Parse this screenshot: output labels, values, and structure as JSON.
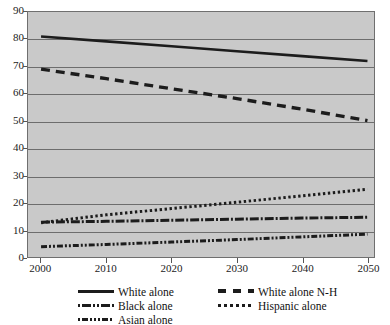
{
  "chart_data": {
    "type": "line",
    "title": "",
    "subtitle": "",
    "xlabel": "",
    "ylabel": "",
    "x": [
      2000,
      2010,
      2020,
      2030,
      2040,
      2050
    ],
    "xlim": [
      1998,
      2051
    ],
    "ylim": [
      0,
      90
    ],
    "xticks": [
      "2000",
      "2010",
      "2020",
      "2030",
      "2040",
      "2050"
    ],
    "yticks": [
      "0",
      "10",
      "20",
      "30",
      "40",
      "50",
      "60",
      "70",
      "80",
      "90"
    ],
    "grid": true,
    "legend_position": "bottom",
    "plot_background": "#c9c9c9",
    "line_color": "#1c1c1c",
    "series": [
      {
        "name": "White alone",
        "style": "solid",
        "values": [
          81,
          79.2,
          77.4,
          75.6,
          73.8,
          72
        ]
      },
      {
        "name": "White alone N-H",
        "style": "long-dash",
        "values": [
          69,
          65.5,
          61.8,
          58.2,
          54.3,
          50.1
        ]
      },
      {
        "name": "Black alone",
        "style": "dash-dot",
        "values": [
          12.8,
          13.1,
          13.5,
          13.9,
          14.3,
          14.6
        ]
      },
      {
        "name": "Hispanic alone",
        "style": "dotted",
        "values": [
          12.6,
          15.5,
          17.8,
          20.1,
          22.5,
          24.9
        ]
      },
      {
        "name": "Asian alone",
        "style": "dash-dot-dot",
        "values": [
          3.8,
          4.6,
          5.5,
          6.4,
          7.4,
          8.4
        ]
      }
    ]
  },
  "axes": {
    "y_tick_labels": [
      "90",
      "80",
      "70",
      "60",
      "50",
      "40",
      "30",
      "20",
      "10",
      "0"
    ],
    "x_tick_labels": [
      "2000",
      "2010",
      "2020",
      "2030",
      "2040",
      "2050"
    ]
  },
  "legend": {
    "items": [
      {
        "label": "White alone",
        "style": "solid",
        "col": 0,
        "row": 0
      },
      {
        "label": "White alone N-H",
        "style": "long-dash",
        "col": 1,
        "row": 0
      },
      {
        "label": "Black alone",
        "style": "dash-dot",
        "col": 0,
        "row": 1
      },
      {
        "label": "Hispanic alone",
        "style": "dotted",
        "col": 1,
        "row": 1
      },
      {
        "label": "Asian alone",
        "style": "dash-dot-dot",
        "col": 0,
        "row": 2
      }
    ]
  }
}
